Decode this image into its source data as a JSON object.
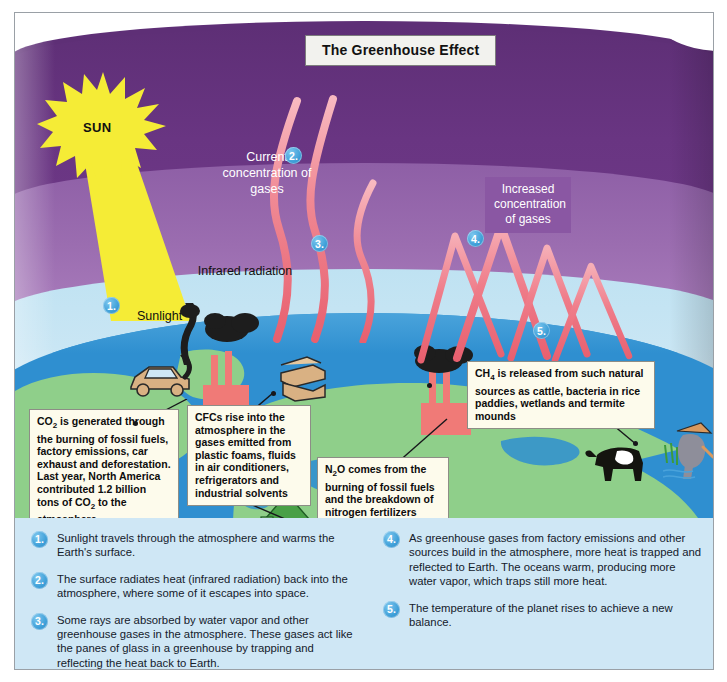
{
  "title": "The Greenhouse Effect",
  "labels": {
    "sun": "SUN",
    "sunlight": "Sunlight",
    "infrared": "Infrared radiation",
    "current_concentration": "Current concentration of gases",
    "increased_concentration": "Increased concentration of gases"
  },
  "markers": {
    "m1": "1.",
    "m2": "2.",
    "m3": "3.",
    "m4": "4.",
    "m5": "5."
  },
  "callouts": {
    "co2": {
      "id": "co2-callout",
      "text_parts": [
        "CO",
        "2",
        " is generated through the burning of fossil fuels, factory emissions, car exhaust and deforestation. Last year, North America contributed 1.2 billion tons of CO",
        "2",
        " to the atmosphere"
      ],
      "plain": "CO2 is generated through the burning of fossil fuels, factory emissions, car exhaust and deforestation. Last year, North America contributed 1.2 billion tons of CO2 to the atmosphere"
    },
    "cfc": {
      "id": "cfc-callout",
      "plain": "CFCs rise into the atmosphere in the gases emitted from plastic foams, fluids in air conditioners, refrigerators and industrial solvents"
    },
    "n2o": {
      "id": "n2o-callout",
      "plain": "N2O comes from the burning of fossil fuels and the breakdown of nitrogen fertilizers"
    },
    "ch4": {
      "id": "ch4-callout",
      "plain": "CH4 is released from such natural sources as cattle, bacteria in rice paddies, wetlands and termite mounds"
    }
  },
  "legend": {
    "left": [
      {
        "num": "1.",
        "text": "Sunlight travels through the atmosphere and warms the Earth's surface."
      },
      {
        "num": "2.",
        "text": "The surface radiates heat (infrared radiation) back into the atmosphere, where some of it escapes into space."
      },
      {
        "num": "3.",
        "text": "Some rays are absorbed by water vapor and other greenhouse gases in the atmosphere. These gases act like the panes of glass in a greenhouse by trapping and reflecting the heat back to Earth."
      }
    ],
    "right": [
      {
        "num": "4.",
        "text": "As greenhouse gases from factory emissions and other sources build in the atmosphere, more heat is trapped and reflected to Earth. The oceans warm, producing more water vapor, which traps still more heat."
      },
      {
        "num": "5.",
        "text": "The temperature of the planet rises to achieve a new balance."
      }
    ]
  },
  "colors": {
    "space_purple": "#5e2f76",
    "atmosphere_purple": "#9b6db0",
    "lower_atmosphere_blue": "#c9e6f4",
    "ocean_blue": "#2f8fd0",
    "land_green": "#8fcf8a",
    "sun_yellow": "#f5ec36",
    "infrared_pink": "#ef6e7e",
    "factory_red": "#f07a77",
    "marker_blue": "#3e9fd8",
    "callout_cream": "#fdfbec",
    "legend_blue": "#cfe7f5"
  },
  "icons": {
    "sun": "sun-starburst-icon",
    "car": "car-icon",
    "factory": "factory-icon",
    "refrigerator": "refrigerator-icon",
    "cow": "cow-icon",
    "rice_farmer": "rice-farmer-icon",
    "tree": "tree-icon"
  }
}
